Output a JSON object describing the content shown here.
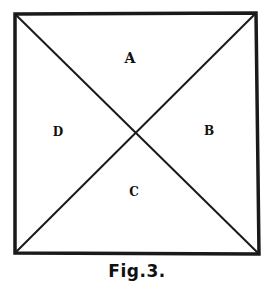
{
  "figure": {
    "caption": "Fig.3.",
    "labels": {
      "top": "A",
      "right": "B",
      "bottom": "C",
      "left": "D"
    },
    "square": {
      "top_left": [
        15,
        14
      ],
      "top_right": [
        256,
        13
      ],
      "bottom_right": [
        259,
        254
      ],
      "bottom_left": [
        15,
        253
      ]
    },
    "diagonals": [
      "top_left-bottom_right",
      "top_right-bottom_left"
    ],
    "stroke_color": "#1a1a1a"
  }
}
